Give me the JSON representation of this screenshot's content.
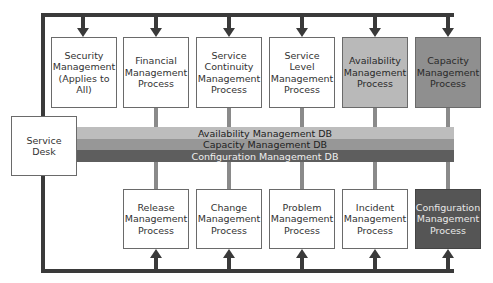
{
  "diagram": {
    "top_processes": [
      {
        "label": "Security\nManagement\n(Applies to All)",
        "fill": "#ffffff",
        "text_color": "#333333"
      },
      {
        "label": "Financial\nManagement\nProcess",
        "fill": "#ffffff",
        "text_color": "#333333"
      },
      {
        "label": "Service\nContinuity\nManagement\nProcess",
        "fill": "#ffffff",
        "text_color": "#333333"
      },
      {
        "label": "Service Level\nManagement\nProcess",
        "fill": "#ffffff",
        "text_color": "#333333"
      },
      {
        "label": "Availability\nManagement\nProcess",
        "fill": "#b9b9b9",
        "text_color": "#2a2a2a"
      },
      {
        "label": "Capacity\nManagement\nProcess",
        "fill": "#8f8f8f",
        "text_color": "#2a2a2a"
      }
    ],
    "bottom_processes": [
      {
        "label": "Release\nManagement\nProcess",
        "fill": "#ffffff",
        "text_color": "#333333"
      },
      {
        "label": "Change\nManagement\nProcess",
        "fill": "#ffffff",
        "text_color": "#333333"
      },
      {
        "label": "Problem\nManagement\nProcess",
        "fill": "#ffffff",
        "text_color": "#333333"
      },
      {
        "label": "Incident\nManagement\nProcess",
        "fill": "#ffffff",
        "text_color": "#333333"
      },
      {
        "label": "Configuration\nManagement\nProcess",
        "fill": "#555555",
        "text_color": "#e8e8e8"
      }
    ],
    "service_desk": {
      "label": "Service\nDesk"
    },
    "databases": [
      {
        "label": "Availability Management DB",
        "fill": "#bdbdbd",
        "text_color": "#222222"
      },
      {
        "label": "Capacity Management DB",
        "fill": "#979797",
        "text_color": "#1e1e1e"
      },
      {
        "label": "Configuration Management DB",
        "fill": "#5e5e5e",
        "text_color": "#eeeeee"
      }
    ],
    "colors": {
      "frame_line": "#3a3a3a",
      "connector": "#8a8a8a",
      "box_border": "#6a6a6a"
    }
  }
}
